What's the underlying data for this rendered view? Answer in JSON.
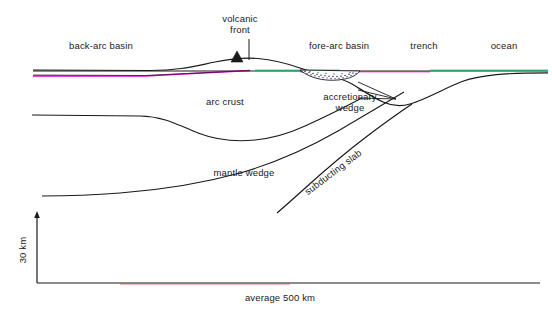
{
  "diagram": {
    "background_color": "#ffffff",
    "line_color": "#1a1a1a",
    "text_color": "#1a1a1a",
    "sea_surface_colors": [
      "#00b050",
      "#e000d0",
      "#1a1a1a"
    ],
    "labels": {
      "back_arc_basin": "back-arc basin",
      "volcanic_front_line1": "volcanic",
      "volcanic_front_line2": "front",
      "fore_arc_basin": "fore-arc basin",
      "trench": "trench",
      "ocean": "ocean",
      "arc_crust": "arc crust",
      "accretionary_wedge_line1": "accretionary",
      "accretionary_wedge_line2": "wedge",
      "mantle_wedge": "mantle wedge",
      "subducting_slab": "subducting slab",
      "scale_vertical": "30 km",
      "scale_horizontal": "average 500 km"
    },
    "scale": {
      "vertical_value": 30,
      "vertical_unit": "km",
      "horizontal_value": 500,
      "horizontal_unit": "km",
      "horizontal_qualifier": "average"
    },
    "features": [
      "back-arc basin",
      "volcanic front",
      "fore-arc basin",
      "trench",
      "ocean",
      "arc crust",
      "accretionary wedge",
      "mantle wedge",
      "subducting slab"
    ]
  }
}
